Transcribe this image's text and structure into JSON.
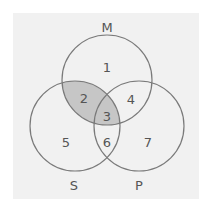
{
  "diagram": {
    "type": "venn",
    "sets": [
      {
        "id": "M",
        "label": "M",
        "cx": 107,
        "cy": 80,
        "r": 45,
        "label_x": 107,
        "label_y": 27
      },
      {
        "id": "S",
        "label": "S",
        "cx": 75,
        "cy": 126,
        "r": 45,
        "label_x": 74,
        "label_y": 185
      },
      {
        "id": "P",
        "label": "P",
        "cx": 139,
        "cy": 126,
        "r": 45,
        "label_x": 139,
        "label_y": 185
      }
    ],
    "regions": [
      {
        "label": "1",
        "x": 107,
        "y": 67,
        "sets": [
          "M"
        ],
        "shaded": false
      },
      {
        "label": "2",
        "x": 84,
        "y": 98,
        "sets": [
          "M",
          "S"
        ],
        "shaded": true
      },
      {
        "label": "3",
        "x": 107,
        "y": 116,
        "sets": [
          "M",
          "S",
          "P"
        ],
        "shaded": true
      },
      {
        "label": "4",
        "x": 131,
        "y": 99,
        "sets": [
          "M",
          "P"
        ],
        "shaded": false
      },
      {
        "label": "5",
        "x": 66,
        "y": 142,
        "sets": [
          "S"
        ],
        "shaded": false
      },
      {
        "label": "6",
        "x": 107,
        "y": 142,
        "sets": [
          "S",
          "P"
        ],
        "shaded": false
      },
      {
        "label": "7",
        "x": 148,
        "y": 142,
        "sets": [
          "P"
        ],
        "shaded": false
      }
    ],
    "shaded_intersection": "M ∩ S",
    "colors": {
      "background": "#f1f1f1",
      "outline": "#7a7a7a",
      "shade": "#c6c6c6",
      "text": "#555555"
    }
  }
}
